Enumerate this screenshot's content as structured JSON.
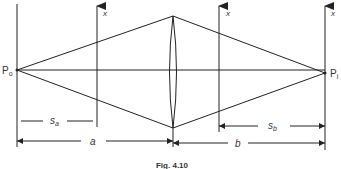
{
  "figure": {
    "caption": "Fig. 4.10",
    "points": {
      "object": {
        "label": "P",
        "subscript": "o"
      },
      "image": {
        "label": "P",
        "subscript": "i"
      }
    },
    "axes": [
      {
        "label": "x"
      },
      {
        "label": "x"
      },
      {
        "label": "x"
      }
    ],
    "dimensions": {
      "s_a": {
        "label": "s",
        "subscript": "a"
      },
      "a": {
        "label": "a"
      },
      "s_b": {
        "label": "s",
        "subscript": "b"
      },
      "b": {
        "label": "b"
      }
    },
    "colors": {
      "line": "#222222",
      "background": "#ffffff"
    }
  }
}
